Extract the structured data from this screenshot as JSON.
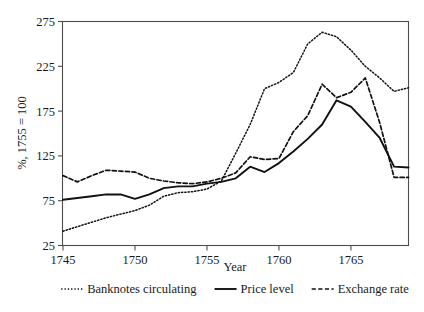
{
  "chart_data": {
    "type": "line",
    "title": "",
    "xlabel": "Year",
    "ylabel": "%, 1755 = 100",
    "xlim": [
      1745,
      1769
    ],
    "ylim": [
      25,
      275
    ],
    "grid": false,
    "legend_position": "bottom",
    "yticks": [
      25,
      75,
      125,
      175,
      225,
      275
    ],
    "ytick_labels": [
      "25",
      "75",
      "125",
      "175",
      "225",
      "275"
    ],
    "xticks": [
      1745,
      1750,
      1755,
      1760,
      1765
    ],
    "xtick_labels": [
      "1745",
      "1750",
      "1755",
      "1760",
      "1765"
    ],
    "x": [
      1745,
      1746,
      1747,
      1748,
      1749,
      1750,
      1751,
      1752,
      1753,
      1754,
      1755,
      1756,
      1757,
      1758,
      1759,
      1760,
      1761,
      1762,
      1763,
      1764,
      1765,
      1766,
      1767,
      1768,
      1769
    ],
    "series": [
      {
        "name": "Banknotes circulating",
        "style": "dotted",
        "color": "#111111",
        "values": [
          41,
          46,
          51,
          56,
          60,
          64,
          70,
          80,
          84,
          85,
          88,
          97,
          128,
          160,
          200,
          207,
          218,
          250,
          263,
          258,
          243,
          225,
          212,
          197,
          201
        ]
      },
      {
        "name": "Price level",
        "style": "solid",
        "color": "#111111",
        "values": [
          76,
          78,
          80,
          82,
          82,
          77,
          82,
          89,
          91,
          91,
          94,
          96,
          100,
          113,
          107,
          117,
          130,
          144,
          160,
          187,
          180,
          163,
          145,
          113,
          112
        ]
      },
      {
        "name": "Exchange rate",
        "style": "dashed",
        "color": "#111111",
        "values": [
          103,
          96,
          103,
          109,
          108,
          107,
          100,
          97,
          95,
          94,
          96,
          100,
          106,
          124,
          121,
          122,
          152,
          170,
          205,
          190,
          196,
          212,
          162,
          101,
          101
        ]
      }
    ]
  },
  "legend": {
    "items": [
      {
        "label": "Banknotes circulating",
        "style": "dotted"
      },
      {
        "label": "Price level",
        "style": "solid"
      },
      {
        "label": "Exchange rate",
        "style": "dashed"
      }
    ]
  }
}
